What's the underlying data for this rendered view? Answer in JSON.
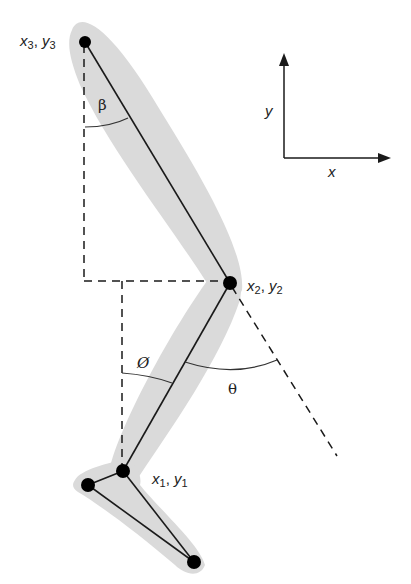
{
  "diagram": {
    "joints": [
      {
        "id": "hip",
        "label_x": "x",
        "label_y": "y",
        "sub": "3",
        "cx": 85,
        "cy": 42
      },
      {
        "id": "knee",
        "label_x": "x",
        "label_y": "y",
        "sub": "2",
        "cx": 230,
        "cy": 283
      },
      {
        "id": "ankle",
        "label_x": "x",
        "label_y": "y",
        "sub": "1",
        "cx": 123,
        "cy": 471
      },
      {
        "id": "heel",
        "cx": 88,
        "cy": 485
      },
      {
        "id": "toe",
        "cx": 194,
        "cy": 562
      }
    ],
    "angles": {
      "beta": "β",
      "phi": "Ø",
      "theta": "θ"
    },
    "axes": {
      "x_label": "x",
      "y_label": "y"
    },
    "labels": {
      "hip_x": "x",
      "hip_sub": "3",
      "hip_sep": ", ",
      "hip_y": "y",
      "knee_x": "x",
      "knee_sub": "2",
      "knee_sep": ", ",
      "knee_y": "y",
      "ankle_x": "x",
      "ankle_sub": "1",
      "ankle_sep": ", ",
      "ankle_y": "y"
    },
    "colors": {
      "segment_fill": "#d9d9d9",
      "line": "#1a1a1a",
      "joint": "#000000"
    }
  }
}
